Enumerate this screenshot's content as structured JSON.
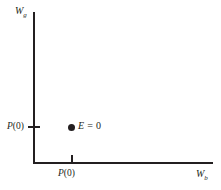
{
  "chart_data": {
    "type": "scatter",
    "title": "",
    "subtitle": "",
    "xlabel": "W_b",
    "ylabel": "W_g",
    "xlabel_base": "W",
    "xlabel_sub": "b",
    "ylabel_base": "W",
    "ylabel_sub": "g",
    "grid": false,
    "legend": "none",
    "xlim": [
      0,
      1
    ],
    "ylim": [
      0,
      1
    ],
    "xticks": [
      {
        "value": 0.21,
        "label_var": "P",
        "label_rest": "(0)"
      }
    ],
    "yticks": [
      {
        "value": 0.235,
        "label_var": "P",
        "label_rest": "(0)"
      }
    ],
    "points": [
      {
        "name": "endowment-point",
        "x": 0.21,
        "y": 0.235,
        "marker": "filled-circle",
        "color": "#231f20",
        "label_var": "E",
        "label_rest": " = 0"
      }
    ],
    "axis_color": "#231f20",
    "background_color": "#ffffff"
  },
  "figure": {
    "y_axis_label_base": "W",
    "y_axis_label_sub": "g",
    "x_axis_label_base": "W",
    "x_axis_label_sub": "b",
    "y_tick_label_var": "P",
    "y_tick_label_rest": "(0)",
    "x_tick_label_var": "P",
    "x_tick_label_rest": "(0)",
    "point_label_var": "E",
    "point_label_rest": " = 0"
  }
}
